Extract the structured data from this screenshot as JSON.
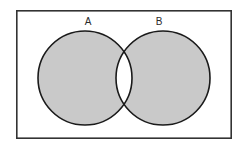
{
  "figure": {
    "type": "venn-diagram",
    "title": "",
    "canvas": {
      "width": 247,
      "height": 150,
      "background": "#ffffff"
    },
    "frame": {
      "name": "universal-set-rectangle",
      "x": 16,
      "y": 10,
      "width": 216,
      "height": 129,
      "stroke": "#333333",
      "stroke_width": 1.6,
      "fill": "#ffffff"
    },
    "sets": [
      {
        "id": "A",
        "label": "A",
        "cx": 85,
        "cy": 78,
        "r": 47,
        "fill": "#c9c9c9",
        "stroke": "#1a1a1a",
        "stroke_width": 1.6,
        "label_x": 88,
        "label_y": 25
      },
      {
        "id": "B",
        "label": "B",
        "cx": 163,
        "cy": 78,
        "r": 47,
        "fill": "#c9c9c9",
        "stroke": "#1a1a1a",
        "stroke_width": 1.6,
        "label_x": 159,
        "label_y": 25
      }
    ],
    "shading": {
      "description": "Both circles are shaded gray except the overlapping lens region, which is left white.",
      "shaded_regions": [
        "A only",
        "B only"
      ],
      "unshaded_regions": [
        "A intersect B",
        "outside A union B"
      ],
      "shaded_fill": "#c9c9c9",
      "unshaded_fill": "#ffffff",
      "set_expression": "(A union B) minus (A intersect B)"
    }
  }
}
